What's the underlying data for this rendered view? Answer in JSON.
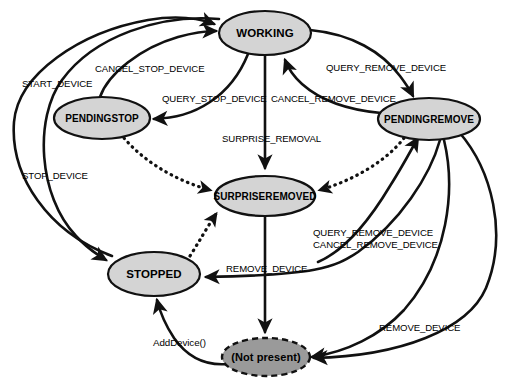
{
  "diagram": {
    "type": "state-machine",
    "canvas": {
      "width": 531,
      "height": 390
    },
    "colors": {
      "node_fill": "#d4d4d4",
      "terminal_fill": "#9a9a9a",
      "stroke": "#111111",
      "background": "#ffffff"
    },
    "states": [
      {
        "id": "working",
        "label": "WORKING",
        "cx": 265,
        "cy": 33,
        "rx": 46,
        "ry": 22,
        "style": "solid"
      },
      {
        "id": "pendingstop",
        "label": "PENDINGSTOP",
        "cx": 102,
        "cy": 118,
        "rx": 48,
        "ry": 21,
        "style": "solid"
      },
      {
        "id": "pendingremove",
        "label": "PENDINGREMOVE",
        "cx": 429,
        "cy": 119,
        "rx": 51,
        "ry": 21,
        "style": "solid"
      },
      {
        "id": "surpriseremoved",
        "label": "SURPRISEREMOVED",
        "cx": 265,
        "cy": 196,
        "rx": 50,
        "ry": 20,
        "style": "solid"
      },
      {
        "id": "stopped",
        "label": "STOPPED",
        "cx": 154,
        "cy": 274,
        "rx": 46,
        "ry": 22,
        "style": "solid"
      },
      {
        "id": "notpresent",
        "label": "(Not present)",
        "cx": 266,
        "cy": 357,
        "rx": 44,
        "ry": 19,
        "style": "dashed"
      }
    ],
    "transitions": [
      {
        "id": "t1",
        "label": "START_DEVICE",
        "from": "stopped",
        "to": "working",
        "label_x": 22,
        "label_y": 87
      },
      {
        "id": "t2",
        "label": "CANCEL_STOP_DEVICE",
        "from": "pendingstop",
        "to": "working",
        "label_x": 95,
        "label_y": 72
      },
      {
        "id": "t3",
        "label": "QUERY_STOP_DEVICE",
        "from": "working",
        "to": "pendingstop",
        "label_x": 162,
        "label_y": 102
      },
      {
        "id": "t4",
        "label": "CANCEL_REMOVE_DEVICE",
        "from": "pendingremove",
        "to": "working",
        "label_x": 271,
        "label_y": 102
      },
      {
        "id": "t5",
        "label": "QUERY_REMOVE_DEVICE",
        "from": "working",
        "to": "pendingremove",
        "label_x": 326,
        "label_y": 71
      },
      {
        "id": "t6",
        "label": "SURPRISE_REMOVAL",
        "from": "working",
        "to": "surpriseremoved",
        "label_x": 222,
        "label_y": 142
      },
      {
        "id": "t7",
        "label": "STOP_DEVICE",
        "from": "working",
        "to": "stopped",
        "label_x": 22,
        "label_y": 179
      },
      {
        "id": "t8",
        "label": "REMOVE_DEVICE",
        "from": "surpriseremoved",
        "to": "notpresent",
        "label_x": 226,
        "label_y": 272
      },
      {
        "id": "t9",
        "label": "QUERY_REMOVE_DEVICE",
        "from": "stopped",
        "to": "pendingremove",
        "label_x": 313,
        "label_y": 236
      },
      {
        "id": "t10",
        "label": "CANCEL_REMOVE_DEVICE",
        "from": "pendingremove",
        "to": "stopped",
        "label_x": 313,
        "label_y": 248
      },
      {
        "id": "t11",
        "label": "REMOVE_DEVICE",
        "from": "pendingremove",
        "to": "notpresent",
        "label_x": 379,
        "label_y": 331
      },
      {
        "id": "t12",
        "label": "AddDevice()",
        "from": "notpresent",
        "to": "stopped",
        "label_x": 153,
        "label_y": 346
      }
    ],
    "dotted_transitions": [
      {
        "id": "d1",
        "from": "pendingstop",
        "to": "surpriseremoved"
      },
      {
        "id": "d2",
        "from": "pendingremove",
        "to": "surpriseremoved"
      },
      {
        "id": "d3",
        "from": "stopped",
        "to": "surpriseremoved"
      }
    ]
  }
}
